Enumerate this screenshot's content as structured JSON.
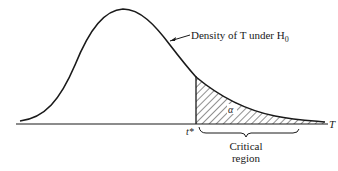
{
  "diagram": {
    "curve_label": "Density of T under H",
    "curve_label_sub": "0",
    "alpha_label": "α",
    "tstar_label": "t*",
    "axis_label": "T",
    "region_label_line1": "Critical",
    "region_label_line2": "region"
  }
}
